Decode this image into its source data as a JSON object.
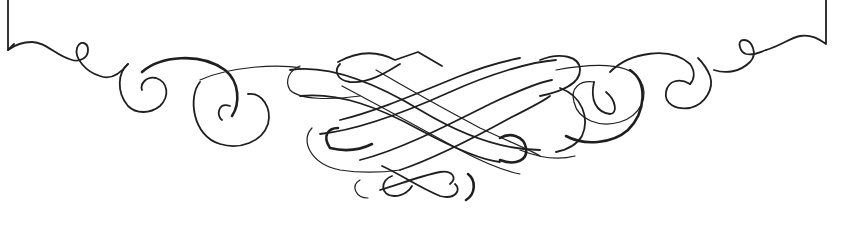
{
  "ornament": {
    "description": "Calligraphic flourish border ornament",
    "stroke_color": "#1f1f1f",
    "background": "#ffffff"
  }
}
